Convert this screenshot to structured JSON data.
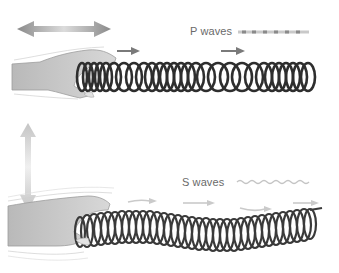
{
  "figure": {
    "panels": [
      {
        "id": "p-waves",
        "label": "P waves",
        "motion": "horizontal push-pull (compression)",
        "legend_glyph": "dashed-compression-line",
        "colors": {
          "arrow": "#7a7a7a",
          "coil": "#2e2e2e",
          "legend": "#9a9a9a"
        }
      },
      {
        "id": "s-waves",
        "label": "S waves",
        "motion": "vertical shake (shear)",
        "legend_glyph": "wavy-line",
        "colors": {
          "arrow": "#c8c8c8",
          "coil": "#3a3a3a",
          "legend": "#bdbdbd"
        }
      }
    ]
  }
}
